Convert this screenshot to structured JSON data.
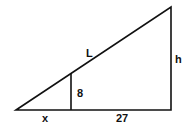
{
  "diagram": {
    "type": "similar-triangles",
    "labels": {
      "hypotenuse": "L",
      "height": "h",
      "inner_height": "8",
      "inner_base": "x",
      "remaining_base": "27"
    },
    "colors": {
      "stroke": "#111111",
      "background": "#ffffff"
    }
  }
}
